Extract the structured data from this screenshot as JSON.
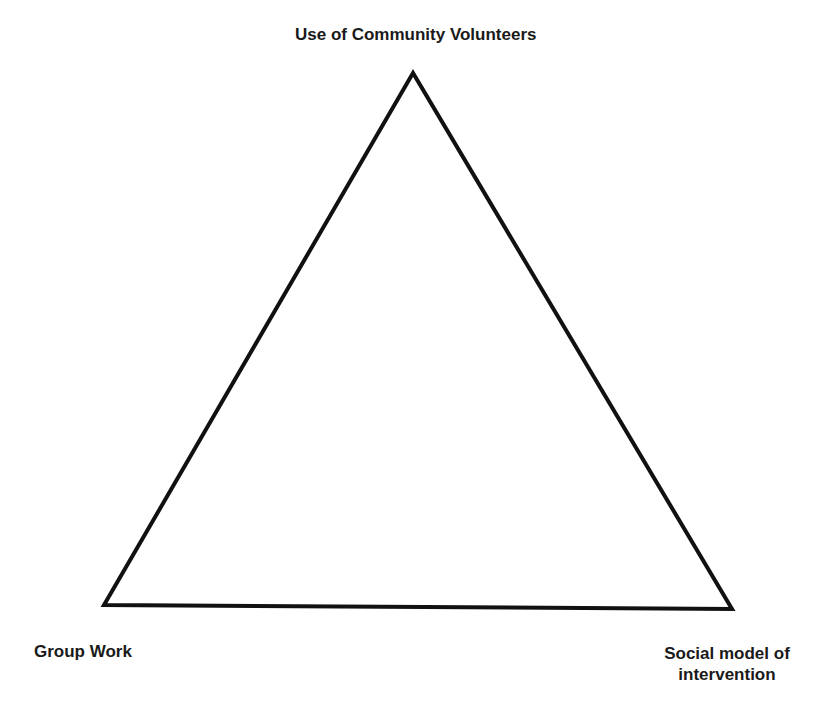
{
  "diagram": {
    "type": "triangle",
    "vertices": {
      "top": {
        "label": "Use of Community Volunteers"
      },
      "bottom_left": {
        "label": "Group Work"
      },
      "bottom_right": {
        "label_line1": "Social model of",
        "label_line2": "intervention"
      }
    },
    "colors": {
      "stroke": "#111111",
      "text": "#1a1a1a",
      "background": "#ffffff"
    }
  }
}
